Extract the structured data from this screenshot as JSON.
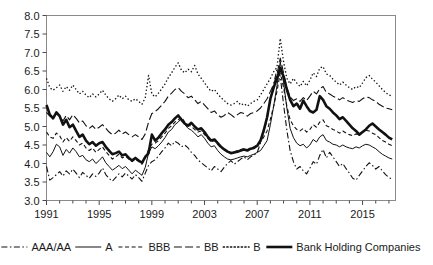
{
  "chart_data": {
    "type": "line",
    "title": "",
    "subtitle": "",
    "xlabel": "",
    "ylabel": "",
    "xlim": [
      1991,
      2017.5
    ],
    "ylim": [
      3.0,
      8.0
    ],
    "grid": false,
    "legend_position": "bottom",
    "yticks": [
      "3.0",
      "3.5",
      "4.0",
      "4.5",
      "5.0",
      "5.5",
      "6.0",
      "6.5",
      "7.0",
      "7.5",
      "8.0"
    ],
    "ytick_values": [
      3.0,
      3.5,
      4.0,
      4.5,
      5.0,
      5.5,
      6.0,
      6.5,
      7.0,
      7.5,
      8.0
    ],
    "xticks": [
      "1991",
      "1995",
      "1999",
      "2003",
      "2007",
      "2011",
      "2015"
    ],
    "xtick_values": [
      1991,
      1995,
      1999,
      2003,
      2007,
      2011,
      2015
    ],
    "x_minor_tick_interval": 1,
    "x": [
      1991.0,
      1991.25,
      1991.5,
      1991.75,
      1992.0,
      1992.25,
      1992.5,
      1992.75,
      1993.0,
      1993.25,
      1993.5,
      1993.75,
      1994.0,
      1994.25,
      1994.5,
      1994.75,
      1995.0,
      1995.25,
      1995.5,
      1995.75,
      1996.0,
      1996.25,
      1996.5,
      1996.75,
      1997.0,
      1997.25,
      1997.5,
      1997.75,
      1998.0,
      1998.25,
      1998.5,
      1998.75,
      1999.0,
      1999.25,
      1999.5,
      1999.75,
      2000.0,
      2000.25,
      2000.5,
      2000.75,
      2001.0,
      2001.25,
      2001.5,
      2001.75,
      2002.0,
      2002.25,
      2002.5,
      2002.75,
      2003.0,
      2003.25,
      2003.5,
      2003.75,
      2004.0,
      2004.25,
      2004.5,
      2004.75,
      2005.0,
      2005.25,
      2005.5,
      2005.75,
      2006.0,
      2006.25,
      2006.5,
      2006.75,
      2007.0,
      2007.25,
      2007.5,
      2007.75,
      2008.0,
      2008.25,
      2008.5,
      2008.75,
      2009.0,
      2009.25,
      2009.5,
      2009.75,
      2010.0,
      2010.25,
      2010.5,
      2010.75,
      2011.0,
      2011.25,
      2011.5,
      2011.75,
      2012.0,
      2012.25,
      2012.5,
      2012.75,
      2013.0,
      2013.25,
      2013.5,
      2013.75,
      2014.0,
      2014.25,
      2014.5,
      2014.75,
      2015.0,
      2015.25,
      2015.5,
      2015.75,
      2016.0,
      2016.25,
      2016.5,
      2016.75,
      2017.0,
      2017.25
    ],
    "series": [
      {
        "name": "AAA/AA",
        "style": "dashdot",
        "width": 1.1,
        "values": [
          3.92,
          3.55,
          3.62,
          3.7,
          3.78,
          3.66,
          3.8,
          3.72,
          3.85,
          3.74,
          3.62,
          3.76,
          3.68,
          3.6,
          3.72,
          3.65,
          3.74,
          3.88,
          3.7,
          3.6,
          3.52,
          3.62,
          3.72,
          3.64,
          3.74,
          3.66,
          3.58,
          3.7,
          3.62,
          3.52,
          3.74,
          3.95,
          4.05,
          4.1,
          4.2,
          4.32,
          4.42,
          4.55,
          4.48,
          4.6,
          4.55,
          4.45,
          4.5,
          4.42,
          4.3,
          4.22,
          4.1,
          4.02,
          3.95,
          3.88,
          3.8,
          3.92,
          3.85,
          3.78,
          3.9,
          4.0,
          4.08,
          3.98,
          4.05,
          4.12,
          4.18,
          4.1,
          4.18,
          4.22,
          4.3,
          4.55,
          4.85,
          5.2,
          5.75,
          6.15,
          6.55,
          6.35,
          5.6,
          4.9,
          4.35,
          4.05,
          3.85,
          3.92,
          3.8,
          3.72,
          3.88,
          4.05,
          3.98,
          4.22,
          4.38,
          4.15,
          4.3,
          4.18,
          4.05,
          3.92,
          4.0,
          3.86,
          3.74,
          3.6,
          3.55,
          3.68,
          3.8,
          3.92,
          4.02,
          3.95,
          3.85,
          3.92,
          3.8,
          3.7,
          3.62,
          3.58
        ]
      },
      {
        "name": "A",
        "style": "solid-thin",
        "width": 1.0,
        "values": [
          4.3,
          4.18,
          4.32,
          4.52,
          4.45,
          4.22,
          4.38,
          4.28,
          4.42,
          4.32,
          4.18,
          4.22,
          4.1,
          4.05,
          4.12,
          4.0,
          4.08,
          4.18,
          4.02,
          3.92,
          3.82,
          3.88,
          3.95,
          3.86,
          3.92,
          3.82,
          3.72,
          3.82,
          3.75,
          3.68,
          3.9,
          4.28,
          4.45,
          4.4,
          4.48,
          4.58,
          4.7,
          4.85,
          4.92,
          5.05,
          5.12,
          5.22,
          5.05,
          4.95,
          4.9,
          4.82,
          4.72,
          4.78,
          4.68,
          4.55,
          4.45,
          4.48,
          4.35,
          4.25,
          4.18,
          4.12,
          4.1,
          4.12,
          4.15,
          4.18,
          4.2,
          4.18,
          4.22,
          4.25,
          4.3,
          4.35,
          4.48,
          4.62,
          5.05,
          5.55,
          6.1,
          6.75,
          6.2,
          5.5,
          4.95,
          4.7,
          4.55,
          4.48,
          4.52,
          4.42,
          4.5,
          4.65,
          4.58,
          4.72,
          4.78,
          4.62,
          4.58,
          4.52,
          4.5,
          4.45,
          4.5,
          4.45,
          4.42,
          4.4,
          4.45,
          4.42,
          4.48,
          4.52,
          4.5,
          4.45,
          4.4,
          4.32,
          4.25,
          4.2,
          4.15,
          4.12
        ]
      },
      {
        "name": "BBB",
        "style": "shortdash",
        "width": 1.1,
        "values": [
          4.85,
          4.72,
          4.68,
          4.82,
          4.75,
          4.58,
          4.7,
          4.6,
          4.72,
          4.62,
          4.5,
          4.55,
          4.42,
          4.35,
          4.42,
          4.3,
          4.38,
          4.45,
          4.32,
          4.22,
          4.12,
          4.18,
          4.25,
          4.15,
          4.2,
          4.12,
          4.05,
          4.12,
          4.05,
          3.98,
          4.15,
          4.38,
          4.52,
          4.55,
          4.62,
          4.72,
          4.82,
          4.95,
          5.02,
          5.12,
          5.18,
          5.25,
          5.12,
          5.05,
          5.0,
          4.92,
          4.85,
          4.88,
          4.78,
          4.68,
          4.58,
          4.62,
          4.52,
          4.42,
          4.38,
          4.32,
          4.3,
          4.32,
          4.35,
          4.38,
          4.4,
          4.38,
          4.42,
          4.45,
          4.5,
          4.58,
          4.72,
          4.88,
          5.2,
          5.55,
          5.95,
          6.45,
          6.05,
          5.55,
          5.18,
          5.02,
          4.92,
          4.88,
          4.95,
          4.85,
          4.92,
          5.05,
          4.98,
          5.12,
          5.18,
          5.02,
          4.98,
          4.92,
          4.88,
          4.82,
          4.88,
          4.82,
          4.78,
          4.75,
          4.8,
          4.78,
          4.85,
          4.9,
          4.88,
          4.82,
          4.78,
          4.7,
          4.62,
          4.58,
          4.52,
          4.48
        ]
      },
      {
        "name": "BB",
        "style": "longdash",
        "width": 1.1,
        "values": [
          5.38,
          5.28,
          5.22,
          5.35,
          5.28,
          5.15,
          5.3,
          5.18,
          5.32,
          5.22,
          5.1,
          5.15,
          5.02,
          4.95,
          5.02,
          4.92,
          4.98,
          5.05,
          4.95,
          4.85,
          4.78,
          4.82,
          4.9,
          4.8,
          4.85,
          4.78,
          4.72,
          4.78,
          4.72,
          4.65,
          4.8,
          5.12,
          5.35,
          5.4,
          5.48,
          5.58,
          5.68,
          5.82,
          5.9,
          6.0,
          6.05,
          5.95,
          5.88,
          5.78,
          5.82,
          5.72,
          5.62,
          5.68,
          5.58,
          5.48,
          5.38,
          5.42,
          5.32,
          5.25,
          5.3,
          5.38,
          5.32,
          5.25,
          5.32,
          5.38,
          5.35,
          5.28,
          5.35,
          5.38,
          5.42,
          5.5,
          5.62,
          5.75,
          5.95,
          6.15,
          6.4,
          6.85,
          6.45,
          6.05,
          5.8,
          5.7,
          5.75,
          5.68,
          5.78,
          5.7,
          5.82,
          5.95,
          5.88,
          6.02,
          6.08,
          5.92,
          5.88,
          5.82,
          5.78,
          5.72,
          5.78,
          5.72,
          5.68,
          5.65,
          5.7,
          5.68,
          5.75,
          5.8,
          5.78,
          5.72,
          5.68,
          5.6,
          5.55,
          5.5,
          5.48,
          5.45
        ]
      },
      {
        "name": "B",
        "style": "dotted",
        "width": 1.3,
        "values": [
          6.3,
          6.05,
          5.98,
          6.05,
          6.12,
          5.95,
          6.08,
          5.98,
          6.12,
          6.0,
          5.88,
          5.95,
          5.85,
          5.78,
          5.88,
          5.8,
          5.88,
          5.98,
          5.85,
          5.75,
          5.68,
          5.75,
          5.85,
          5.75,
          5.82,
          5.72,
          5.68,
          5.75,
          5.68,
          5.6,
          5.78,
          6.38,
          5.88,
          5.8,
          5.9,
          6.02,
          6.15,
          6.32,
          6.45,
          6.6,
          6.72,
          6.52,
          6.45,
          6.55,
          6.48,
          6.65,
          6.42,
          6.3,
          6.18,
          6.05,
          5.95,
          6.0,
          5.88,
          5.78,
          5.7,
          5.62,
          5.58,
          5.62,
          5.68,
          5.58,
          5.62,
          5.55,
          5.62,
          5.68,
          5.72,
          5.85,
          6.0,
          6.15,
          6.3,
          6.48,
          6.6,
          7.38,
          6.75,
          6.3,
          6.15,
          6.3,
          6.18,
          6.08,
          6.22,
          6.1,
          6.25,
          6.45,
          6.35,
          6.58,
          6.62,
          6.42,
          6.38,
          6.28,
          6.2,
          6.12,
          6.2,
          6.12,
          6.05,
          6.0,
          6.08,
          6.05,
          6.18,
          6.32,
          6.38,
          6.28,
          6.2,
          6.1,
          6.0,
          5.92,
          5.85,
          5.82
        ]
      },
      {
        "name": "Bank Holding Companies",
        "style": "thick-solid",
        "width": 2.6,
        "values": [
          5.58,
          5.32,
          5.22,
          5.38,
          5.28,
          5.05,
          5.18,
          4.98,
          5.05,
          4.88,
          4.72,
          4.78,
          4.62,
          4.52,
          4.58,
          4.48,
          4.55,
          4.58,
          4.45,
          4.35,
          4.25,
          4.28,
          4.32,
          4.22,
          4.25,
          4.15,
          4.08,
          4.15,
          4.08,
          4.02,
          4.18,
          4.28,
          4.78,
          4.62,
          4.7,
          4.82,
          4.92,
          5.05,
          5.12,
          5.22,
          5.3,
          5.18,
          5.08,
          5.02,
          5.1,
          5.0,
          4.92,
          4.95,
          4.85,
          4.72,
          4.62,
          4.65,
          4.55,
          4.45,
          4.38,
          4.32,
          4.28,
          4.3,
          4.32,
          4.35,
          4.38,
          4.35,
          4.4,
          4.42,
          4.48,
          4.62,
          4.9,
          5.25,
          5.75,
          6.05,
          6.3,
          6.58,
          6.35,
          6.0,
          5.72,
          5.55,
          5.62,
          5.48,
          5.7,
          5.55,
          5.42,
          5.38,
          5.45,
          5.82,
          5.72,
          5.55,
          5.48,
          5.38,
          5.3,
          5.2,
          5.25,
          5.15,
          5.05,
          4.95,
          4.88,
          4.78,
          4.85,
          4.92,
          5.02,
          5.08,
          5.0,
          4.92,
          4.85,
          4.78,
          4.7,
          4.65
        ]
      }
    ]
  },
  "legend": {
    "items": [
      {
        "label": "AAA/AA",
        "style": "dashdot"
      },
      {
        "label": "A",
        "style": "solid-thin"
      },
      {
        "label": "BBB",
        "style": "shortdash"
      },
      {
        "label": "BB",
        "style": "longdash"
      },
      {
        "label": "B",
        "style": "dotted"
      },
      {
        "label": "Bank Holding Companies",
        "style": "thick-solid"
      }
    ]
  },
  "colors": {
    "line": "#111111",
    "frame": "#8a8a8a",
    "text": "#1a1a1a",
    "background": "#ffffff"
  }
}
